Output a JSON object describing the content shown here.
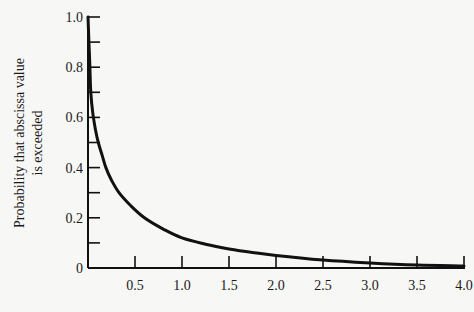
{
  "chart_data": {
    "type": "line",
    "title": "",
    "xlabel": "",
    "ylabel": "Probability that abscissa value is exceeded",
    "ylabel_lines": [
      "Probability that abscissa value",
      "is exceeded"
    ],
    "xlim": [
      0,
      4.0
    ],
    "ylim": [
      0,
      1.0
    ],
    "grid": false,
    "legend": null,
    "x_ticks": [
      0.5,
      1.0,
      1.5,
      2.0,
      2.5,
      3.0,
      3.5,
      4.0
    ],
    "x_tick_labels": [
      "0.5",
      "1.0",
      "1.5",
      "2.0",
      "2.5",
      "3.0",
      "3.5",
      "4.0"
    ],
    "y_ticks": [
      0,
      0.1,
      0.2,
      0.3,
      0.4,
      0.5,
      0.6,
      0.7,
      0.8,
      0.9,
      1.0
    ],
    "y_tick_labels": [
      "0",
      "",
      "0.2",
      "",
      "0.4",
      "",
      "0.6",
      "",
      "0.8",
      "",
      "1.0"
    ],
    "series": [
      {
        "name": "exceedance probability",
        "x": [
          0.0,
          0.01,
          0.02,
          0.03,
          0.05,
          0.08,
          0.11,
          0.15,
          0.19,
          0.25,
          0.33,
          0.45,
          0.6,
          0.8,
          1.0,
          1.25,
          1.5,
          1.75,
          2.0,
          2.5,
          3.0,
          3.5,
          4.0
        ],
        "y": [
          1.0,
          0.9,
          0.8,
          0.7,
          0.62,
          0.55,
          0.5,
          0.45,
          0.4,
          0.35,
          0.3,
          0.25,
          0.2,
          0.155,
          0.12,
          0.095,
          0.076,
          0.062,
          0.05,
          0.032,
          0.02,
          0.012,
          0.008
        ]
      }
    ]
  }
}
